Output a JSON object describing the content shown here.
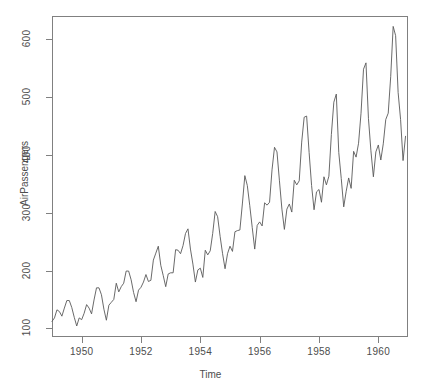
{
  "chart_data": {
    "type": "line",
    "title": "",
    "xlabel": "Time",
    "ylabel": "AirPassengers",
    "xlim": [
      1949.0,
      1961.0
    ],
    "ylim": [
      85,
      640
    ],
    "grid": false,
    "legend": null,
    "x_ticks": [
      1950,
      1952,
      1954,
      1956,
      1958,
      1960
    ],
    "x_tick_labels": [
      "1950",
      "1952",
      "1954",
      "1956",
      "1958",
      "1960"
    ],
    "y_ticks": [
      100,
      200,
      300,
      400,
      500,
      600
    ],
    "y_tick_labels": [
      "100",
      "200",
      "300",
      "400",
      "500",
      "600"
    ],
    "series": [
      {
        "name": "AirPassengers",
        "color": "#595959",
        "x_start": 1949.0,
        "x_step": 0.0833333,
        "values": [
          112,
          118,
          132,
          129,
          121,
          135,
          148,
          148,
          136,
          119,
          104,
          118,
          115,
          126,
          141,
          135,
          125,
          149,
          170,
          170,
          158,
          133,
          114,
          140,
          145,
          150,
          178,
          163,
          172,
          178,
          199,
          199,
          184,
          162,
          146,
          166,
          171,
          180,
          193,
          181,
          183,
          218,
          230,
          242,
          209,
          191,
          172,
          194,
          196,
          196,
          236,
          235,
          229,
          243,
          264,
          272,
          237,
          211,
          180,
          201,
          204,
          188,
          235,
          227,
          234,
          264,
          302,
          293,
          259,
          229,
          203,
          229,
          242,
          233,
          267,
          269,
          270,
          315,
          364,
          347,
          312,
          274,
          237,
          278,
          284,
          277,
          317,
          313,
          318,
          374,
          413,
          405,
          355,
          306,
          271,
          306,
          315,
          301,
          356,
          348,
          355,
          422,
          465,
          467,
          404,
          347,
          305,
          336,
          340,
          318,
          362,
          348,
          363,
          435,
          491,
          505,
          404,
          359,
          310,
          337,
          360,
          342,
          406,
          396,
          420,
          472,
          548,
          559,
          463,
          407,
          362,
          405,
          417,
          391,
          419,
          461,
          472,
          535,
          622,
          606,
          508,
          461,
          390,
          432
        ]
      }
    ]
  },
  "axes": {
    "x_title": "Time",
    "y_title": "AirPassengers"
  },
  "colors": {
    "line": "#595959",
    "axis": "#808080",
    "text": "#4d4d4d",
    "background": "#ffffff"
  }
}
